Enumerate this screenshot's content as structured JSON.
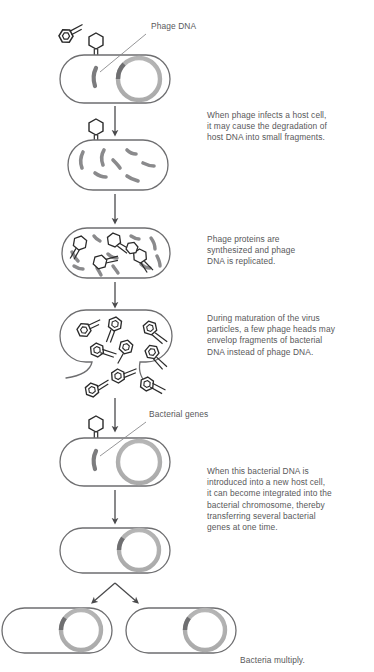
{
  "figure": {
    "colors": {
      "cell_outline": "#6e6e70",
      "chromosome_ring": "#b3b3b3",
      "chromosome_dark_segment": "#6f6f71",
      "dna_fragment": "#8a8a8c",
      "phage_outline": "#2b2b2b",
      "arrow": "#4a4a4c",
      "text": "#58585a",
      "background": "#ffffff"
    }
  },
  "labels": [
    {
      "id": "phage-dna",
      "text": "Phage DNA",
      "x": 151,
      "y": 27
    },
    {
      "id": "bacterial-genes",
      "text": "Bacterial genes",
      "x": 149,
      "y": 415
    }
  ],
  "captions": [
    {
      "id": "caption-infection",
      "x": 207,
      "y": 110,
      "text": "When phage infects a host cell,\nit may cause the degradation of\nhost DNA into small fragments."
    },
    {
      "id": "caption-synthesis",
      "x": 207,
      "y": 234,
      "text": "Phage proteins are\nsynthesized and phage\nDNA is replicated."
    },
    {
      "id": "caption-maturation",
      "x": 207,
      "y": 313,
      "text": "During maturation of the virus\nparticles, a few phage heads may\nenvelop fragments of bacterial\nDNA instead of phage DNA."
    },
    {
      "id": "caption-integration",
      "x": 207,
      "y": 466,
      "text": "When this bacterial DNA is\nintroduced into a new host cell,\nit can become integrated into the\nbacterial chromosome, thereby\ntransferring several bacterial\ngenes at one time."
    },
    {
      "id": "caption-multiply",
      "x": 240,
      "y": 655,
      "text": "Bacteria multiply."
    }
  ],
  "stages": [
    {
      "id": "stage-1-infection",
      "name": "host-cell-infected",
      "cell": {
        "x": 60,
        "y": 55,
        "w": 110,
        "h": 48
      },
      "has_chromosome": true,
      "phage_attached": true,
      "free_phage": true,
      "dna_fragments": 0
    },
    {
      "id": "stage-2-degradation",
      "name": "host-dna-degraded",
      "cell": {
        "x": 68,
        "y": 140,
        "w": 100,
        "h": 50
      },
      "has_chromosome": false,
      "phage_attached": true,
      "free_phage": false,
      "dna_fragments": 7
    },
    {
      "id": "stage-3-synthesis",
      "name": "phage-proteins-synthesized",
      "cell": {
        "x": 62,
        "y": 228,
        "w": 108,
        "h": 50
      },
      "has_chromosome": false,
      "phage_attached": false,
      "free_phage": false,
      "dna_fragments": 10,
      "empty_heads": 5
    },
    {
      "id": "stage-4-maturation",
      "name": "cell-lysing-phage-release",
      "cell": {
        "x": 62,
        "y": 310,
        "w": 108,
        "h": 52
      },
      "mature_phages": 9
    },
    {
      "id": "stage-5-new-host",
      "name": "new-host-cell-transduced",
      "cell": {
        "x": 60,
        "y": 438,
        "w": 110,
        "h": 48
      },
      "has_chromosome": true,
      "phage_attached": true,
      "bacterial_gene_fragment": true
    },
    {
      "id": "stage-6-integrated",
      "name": "genes-integrated",
      "cell": {
        "x": 60,
        "y": 528,
        "w": 110,
        "h": 45
      },
      "has_chromosome": true,
      "integrated_segment": true
    },
    {
      "id": "stage-7-daughter-left",
      "name": "daughter-cell-left",
      "cell": {
        "x": 2,
        "y": 608,
        "w": 110,
        "h": 45
      },
      "has_chromosome": true,
      "integrated_segment": true
    },
    {
      "id": "stage-7-daughter-right",
      "name": "daughter-cell-right",
      "cell": {
        "x": 126,
        "y": 608,
        "w": 110,
        "h": 45
      },
      "has_chromosome": true,
      "integrated_segment": true
    }
  ],
  "arrows": [
    {
      "id": "arrow-1",
      "from": "stage-1-infection",
      "to": "stage-2-degradation",
      "x": 115,
      "y1": 106,
      "y2": 134
    },
    {
      "id": "arrow-2",
      "from": "stage-2-degradation",
      "to": "stage-3-synthesis",
      "x": 115,
      "y1": 194,
      "y2": 222
    },
    {
      "id": "arrow-3",
      "from": "stage-3-synthesis",
      "to": "stage-4-maturation",
      "x": 115,
      "y1": 282,
      "y2": 306
    },
    {
      "id": "arrow-4",
      "from": "stage-4-maturation",
      "to": "stage-5-new-host",
      "x": 115,
      "y1": 396,
      "y2": 430
    },
    {
      "id": "arrow-5",
      "from": "stage-5-new-host",
      "to": "stage-6-integrated",
      "x": 115,
      "y1": 490,
      "y2": 522
    },
    {
      "id": "arrow-6-left",
      "from": "stage-6-integrated",
      "to": "stage-7-daughter-left",
      "x1": 115,
      "y1": 583,
      "x2": 92,
      "y2": 603
    },
    {
      "id": "arrow-6-right",
      "from": "stage-6-integrated",
      "to": "stage-7-daughter-right",
      "x1": 115,
      "y1": 583,
      "x2": 138,
      "y2": 603
    }
  ]
}
